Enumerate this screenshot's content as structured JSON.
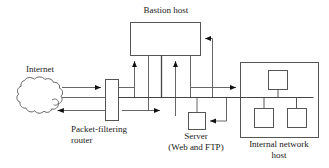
{
  "diagram": {
    "stroke_color": "#555555",
    "text_color": "#1a1a1a",
    "background": "#ffffff",
    "nodes": [
      {
        "id": "internet",
        "label": "Internet",
        "shape": "cloud",
        "label_position": "above"
      },
      {
        "id": "packet-filtering-router",
        "label_line1": "Packet-filtering",
        "label_line2": "router",
        "shape": "vertical-rectangle",
        "label_position": "below"
      },
      {
        "id": "bastion-host",
        "label": "Bastion host",
        "shape": "rectangle",
        "label_position": "above"
      },
      {
        "id": "server",
        "label_line1": "Server",
        "label_line2": "(Web and FTP)",
        "shape": "square",
        "label_position": "below"
      },
      {
        "id": "internal-network-host",
        "label_line1": "Internal network",
        "label_line2": "host",
        "shape": "rectangle-with-hosts",
        "host_count": 3,
        "label_position": "below"
      }
    ]
  }
}
